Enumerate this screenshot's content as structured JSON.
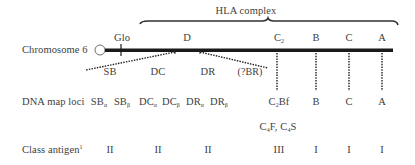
{
  "title": "HLA complex",
  "chromosome": {
    "label": "Chromosome 6",
    "markers": [
      {
        "id": "glo",
        "label": "Glo",
        "x": 121
      },
      {
        "id": "d",
        "label": "D",
        "x": 186
      },
      {
        "id": "c2",
        "label": "C",
        "sub": "2",
        "x": 277
      },
      {
        "id": "b",
        "label": "B",
        "x": 316
      },
      {
        "id": "c",
        "label": "C",
        "x": 349
      },
      {
        "id": "a",
        "label": "A",
        "x": 382
      }
    ]
  },
  "d_region": {
    "subregions": [
      "SB",
      "DC",
      "DR",
      "(?BR)"
    ]
  },
  "rows": {
    "dna_map_loci": {
      "label": "DNA map loci",
      "items": [
        {
          "main": "SB",
          "sub": "α"
        },
        {
          "main": "SB",
          "sub": "β"
        },
        {
          "main": "DC",
          "sub": "α"
        },
        {
          "main": "DC",
          "sub": "β"
        },
        {
          "main": "DR",
          "sub": "α"
        },
        {
          "main": "DR",
          "sub": "β"
        },
        {
          "main": "C",
          "sub": "2",
          "suffix": "Bf"
        },
        {
          "main": "B"
        },
        {
          "main": "C"
        },
        {
          "main": "A"
        }
      ],
      "complement": {
        "a_main": "C",
        "a_sub": "4",
        "a_suffix": "F,",
        "b_main": "C",
        "b_sub": "4",
        "b_suffix": "S"
      }
    },
    "class_antigen": {
      "label": "Class antigen",
      "footnote": "1",
      "values": [
        "II",
        "II",
        "II",
        "III",
        "I",
        "I",
        "I"
      ]
    }
  }
}
